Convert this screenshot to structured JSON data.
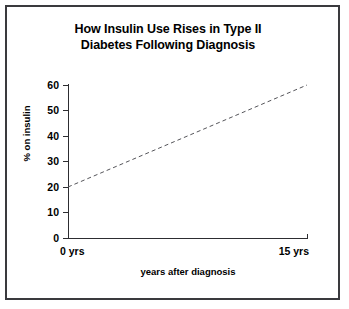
{
  "figure": {
    "background_color": "#ffffff",
    "frame_color": "#3a3a3e",
    "axis_color": "#2d2d31",
    "text_color": "#000000",
    "series_color": "#55555a"
  },
  "title_line_1": "How Insulin Use Rises in Type II",
  "title_line_2": "Diabetes Following Diagnosis",
  "title_full": "How Insulin Use Rises in Type II Diabetes Following Diagnosis",
  "axes": {
    "y_title": "% on insulin",
    "x_title": "years after diagnosis",
    "y_ticks": [
      "60",
      "50",
      "40",
      "30",
      "20",
      "10",
      "0"
    ],
    "x_tick_labels": [
      "0 yrs",
      "15 yrs"
    ]
  },
  "chart_data": {
    "type": "line",
    "title": "How Insulin Use Rises in Type II Diabetes Following Diagnosis",
    "xlabel": "years after diagnosis",
    "ylabel": "% on insulin",
    "xlim": [
      0,
      15
    ],
    "ylim": [
      0,
      60
    ],
    "x_tick_values": [
      0,
      15
    ],
    "x_tick_labels": [
      "0 yrs",
      "15 yrs"
    ],
    "y_tick_values": [
      0,
      10,
      20,
      30,
      40,
      50,
      60
    ],
    "y_tick_labels": [
      "0",
      "10",
      "20",
      "30",
      "40",
      "50",
      "60"
    ],
    "grid": false,
    "legend": "none",
    "series": [
      {
        "name": "% on insulin",
        "style": "dashed",
        "color": "#55555a",
        "x": [
          0,
          15
        ],
        "values": [
          20,
          60
        ],
        "points": [
          {
            "x": 0,
            "y": 20,
            "x_label": "0 yrs"
          },
          {
            "x": 15,
            "y": 60,
            "x_label": "15 yrs"
          }
        ],
        "slope_per_year": 2.67
      }
    ],
    "annotations": []
  }
}
